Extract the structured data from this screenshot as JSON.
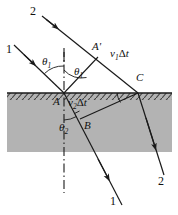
{
  "figure": {
    "colors": {
      "medium_fill": "#b3b3b3",
      "line": "#1a1a1a",
      "background": "#ffffff",
      "hatch": "#4d4d4d"
    },
    "interface": {
      "label": "boundary-surface",
      "y": 93,
      "x_start": 7,
      "x_end": 172,
      "medium_bottom": 152
    },
    "ray_labels": {
      "incident_upper": "2",
      "incident_lower": "1",
      "refracted_lower": "1",
      "refracted_right": "2"
    },
    "point_labels": {
      "a": "A",
      "a_prime": "A'",
      "b": "B",
      "c": "C"
    },
    "angle_labels": {
      "theta1_left": "θ",
      "theta1_left_sub": "1",
      "theta1_right": "θ",
      "theta1_right_sub": "1",
      "theta2": "θ",
      "theta2_sub": "2"
    },
    "distance_labels": {
      "upper": {
        "v": "v",
        "sub": "1",
        "delta": "Δ",
        "t": "t"
      },
      "lower": {
        "v": "v",
        "sub": "2",
        "delta": "Δ",
        "t": "t"
      }
    },
    "geometry": {
      "vertex_A": [
        64,
        93
      ],
      "point_A_prime": [
        98,
        57
      ],
      "point_B": [
        80,
        119
      ],
      "point_C": [
        138,
        93
      ],
      "normal_top": [
        64,
        48
      ],
      "normal_bottom": [
        64,
        193
      ]
    }
  }
}
